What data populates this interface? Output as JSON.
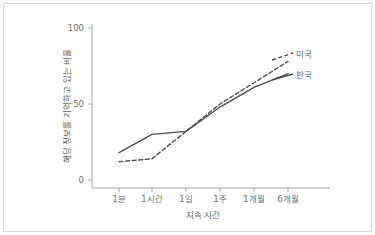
{
  "chart_data": {
    "type": "line",
    "title": "",
    "xlabel": "지속 시간",
    "ylabel": "해당 정보를 기억하고 있는 비율",
    "categories": [
      "1분",
      "1시간",
      "1일",
      "1주",
      "1개월",
      "6개월"
    ],
    "ylim": [
      0,
      100
    ],
    "yticks": [
      0,
      50,
      100
    ],
    "ytick_labels": [
      "0",
      "50",
      "100"
    ],
    "grid": false,
    "legend_position": "right-inline",
    "series": [
      {
        "name": "미국",
        "style": "dashed",
        "color": "#4d4d4d",
        "values": [
          12,
          14,
          32,
          50,
          64,
          78
        ]
      },
      {
        "name": "한국",
        "style": "solid",
        "color": "#4d4d4d",
        "values": [
          18,
          30,
          32,
          48,
          61,
          70
        ]
      }
    ]
  },
  "axes": {
    "y_tick_0": "0",
    "y_tick_50": "50",
    "y_tick_100": "100",
    "x_tick_0": "1분",
    "x_tick_1": "1시간",
    "x_tick_2": "1일",
    "x_tick_3": "1주",
    "x_tick_4": "1개월",
    "x_tick_5": "6개월",
    "x_title": "지속 시간",
    "y_title": "해당 정보를 기억하고 있는 비율"
  },
  "legend": {
    "usa": "미국",
    "korea": "한국"
  },
  "colors": {
    "line": "#4d4d4d",
    "axis": "#a9a9a9",
    "text": "#5f5f5f",
    "border": "#d8d8d8",
    "background": "#ffffff"
  }
}
